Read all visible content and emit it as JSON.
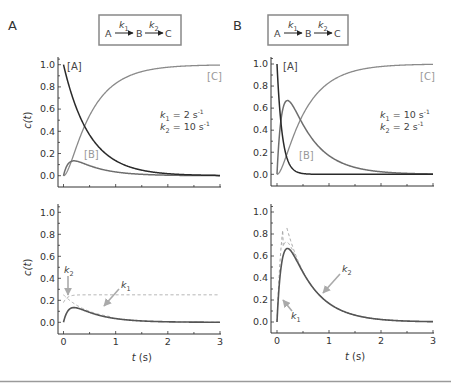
{
  "chart_data": [
    {
      "panel": "A",
      "type": "line",
      "letter": "A",
      "scheme": {
        "a": "A",
        "b": "B",
        "c": "C",
        "k1": "k",
        "k1_sub": "1",
        "k2": "k",
        "k2_sub": "2"
      },
      "k1": 2,
      "k2": 10,
      "rate_text": {
        "k1_label": "k",
        "k1_sub": "1",
        "k1_value": " = 2 s",
        "k2_label": "k",
        "k2_sub": "2",
        "k2_value": " = 10 s",
        "unit_exp": "-1"
      },
      "curve_labels": {
        "A": "[A]",
        "B": "[B]",
        "C": "[C]"
      },
      "ylabel": "c(t)",
      "xlabel": "",
      "xlim": [
        0,
        3
      ],
      "ylim": [
        0,
        1.0
      ],
      "yticks": [
        "0.0",
        "0.2",
        "0.4",
        "0.6",
        "0.8",
        "1.0"
      ],
      "xticks": [],
      "series": [
        {
          "name": "[A]",
          "formula": "exp(-k1 t)",
          "color": "#333333"
        },
        {
          "name": "[B]",
          "formula": "k1/(k2-k1)(exp(-k1 t)-exp(-k2 t))",
          "color": "#777777",
          "peak": 0.13
        },
        {
          "name": "[C]",
          "formula": "1-[A]-[B]",
          "color": "#888888"
        }
      ]
    },
    {
      "panel": "B",
      "type": "line",
      "letter": "B",
      "scheme": {
        "a": "A",
        "b": "B",
        "c": "C",
        "k1": "k",
        "k1_sub": "1",
        "k2": "k",
        "k2_sub": "2"
      },
      "k1": 10,
      "k2": 2,
      "rate_text": {
        "k1_label": "k",
        "k1_sub": "1",
        "k1_value": " = 10 s",
        "k2_label": "k",
        "k2_sub": "2",
        "k2_value": " = 2 s",
        "unit_exp": "-1"
      },
      "curve_labels": {
        "A": "[A]",
        "B": "[B]",
        "C": "[C]"
      },
      "ylabel": "",
      "xlabel": "",
      "xlim": [
        0,
        3
      ],
      "ylim": [
        0,
        1.0
      ],
      "yticks": [
        "0.0",
        "0.2",
        "0.4",
        "0.6",
        "0.8",
        "1.0"
      ],
      "xticks": [],
      "series": [
        {
          "name": "[A]",
          "formula": "exp(-k1 t)",
          "color": "#333333"
        },
        {
          "name": "[B]",
          "formula": "k1/(k2-k1)(exp(-k1 t)-exp(-k2 t))",
          "color": "#777777",
          "peak": 0.67
        },
        {
          "name": "[C]",
          "formula": "1-[A]-[B]",
          "color": "#888888"
        }
      ]
    },
    {
      "panel": "C",
      "type": "line",
      "k1": 2,
      "k2": 10,
      "ylabel": "c(t)",
      "xlabel": "t (s)",
      "xlim": [
        0,
        3
      ],
      "ylim": [
        0,
        1.0
      ],
      "yticks": [
        "0.0",
        "0.2",
        "0.4",
        "0.6",
        "0.8",
        "1.0"
      ],
      "xticks": [
        "0",
        "1",
        "2",
        "3"
      ],
      "annotations": {
        "upper_arrow": {
          "label": "k",
          "sub": "2"
        },
        "lower_arrow": {
          "label": "k",
          "sub": "1"
        }
      },
      "series": [
        {
          "name": "[B]",
          "style": "solid",
          "color": "#555555",
          "peak": 0.13
        },
        {
          "name": "rise term",
          "style": "dashed",
          "color": "#aaaaaa",
          "plateau": 0.25
        },
        {
          "name": "decay term",
          "style": "dashed",
          "color": "#aaaaaa",
          "start": 0.25
        }
      ]
    },
    {
      "panel": "D",
      "type": "line",
      "k1": 10,
      "k2": 2,
      "ylabel": "",
      "xlabel": "t (s)",
      "xlim": [
        0,
        3
      ],
      "ylim": [
        0,
        1.0
      ],
      "yticks": [
        "0.0",
        "0.2",
        "0.4",
        "0.6",
        "0.8",
        "1.0"
      ],
      "xticks": [
        "0",
        "1",
        "2",
        "3"
      ],
      "annotations": {
        "upper_arrow": {
          "label": "k",
          "sub": "2"
        },
        "lower_arrow": {
          "label": "k",
          "sub": "1"
        }
      },
      "series": [
        {
          "name": "[B]",
          "style": "solid",
          "color": "#555555",
          "peak": 0.67
        },
        {
          "name": "rise term",
          "style": "dashed",
          "color": "#aaaaaa",
          "plateau": 1.25
        },
        {
          "name": "decay term",
          "style": "dashed",
          "color": "#aaaaaa",
          "start": 1.25
        }
      ]
    }
  ]
}
